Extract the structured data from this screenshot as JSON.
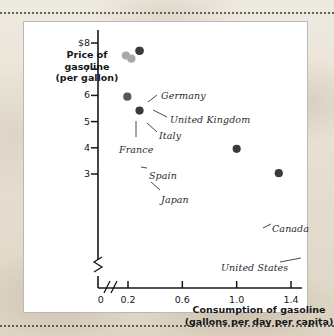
{
  "figure": {
    "background_color": "#e9e3d8",
    "panel_color": "#ffffff",
    "panel_border_color": "#b9b9b9"
  },
  "chart_data": {
    "type": "scatter",
    "title": "",
    "xlabel": "Consumption of gasoline\n(gallons per day per capita)",
    "ylabel": "Price of gasoline\n(per gallon)",
    "xlabel_line1": "Consumption of gasoline",
    "xlabel_line2": "(gallons per day per capita)",
    "ylabel_line1": "Price of",
    "ylabel_line2": "gasoline",
    "ylabel_line3": "(per gallon)",
    "xlim": [
      0,
      1.55
    ],
    "ylim": [
      2.4,
      8.4
    ],
    "x_axis_break": true,
    "y_axis_break": true,
    "grid": false,
    "legend": "none",
    "xticks": [
      {
        "value": 0,
        "label": "0"
      },
      {
        "value": 0.2,
        "label": "0.2"
      },
      {
        "value": 0.6,
        "label": "0.6"
      },
      {
        "value": 1.0,
        "label": "1.0"
      },
      {
        "value": 1.4,
        "label": "1.4"
      }
    ],
    "yticks": [
      {
        "value": 8,
        "label": "$8"
      },
      {
        "value": 7,
        "label": "7"
      },
      {
        "value": 6,
        "label": "6"
      },
      {
        "value": 5,
        "label": "5"
      },
      {
        "value": 4,
        "label": "4"
      },
      {
        "value": 3,
        "label": "3"
      }
    ],
    "marker_colors": {
      "dark": "#3b3b3f",
      "medium": "#58585c",
      "light": "#a9a9ad"
    },
    "points": [
      {
        "name": "Germany",
        "x": 0.285,
        "y": 7.7,
        "shade": "dark",
        "label": "Germany",
        "label_x": 137,
        "label_y": 68,
        "leader": [
          [
            124,
            80
          ],
          [
            133,
            73
          ]
        ]
      },
      {
        "name": "United Kingdom",
        "x": 0.285,
        "y": 7.7,
        "shade": "dark",
        "label": "United Kingdom",
        "label_x": 146,
        "label_y": 92,
        "leader": [
          [
            129,
            88
          ],
          [
            143,
            95
          ]
        ]
      },
      {
        "name": "Italy",
        "x": 0.225,
        "y": 7.4,
        "shade": "light",
        "label": "Italy",
        "label_x": 135,
        "label_y": 108,
        "leader": [
          [
            123,
            101
          ],
          [
            133,
            110
          ]
        ]
      },
      {
        "name": "France",
        "x": 0.185,
        "y": 7.52,
        "shade": "light",
        "label": "France",
        "label_x": 95,
        "label_y": 122,
        "leader": [
          [
            112,
            99
          ],
          [
            112,
            115
          ]
        ]
      },
      {
        "name": "Spain",
        "x": 0.195,
        "y": 5.95,
        "shade": "medium",
        "label": "Spain",
        "label_x": 125,
        "label_y": 148,
        "leader": [
          [
            117,
            145
          ],
          [
            123,
            146
          ]
        ]
      },
      {
        "name": "Japan",
        "x": 0.285,
        "y": 5.42,
        "shade": "dark",
        "label": "Japan",
        "label_x": 137,
        "label_y": 172,
        "leader": [
          [
            127,
            160
          ],
          [
            136,
            168
          ]
        ]
      },
      {
        "name": "Canada",
        "x": 1.0,
        "y": 3.96,
        "shade": "dark",
        "label": "Canada",
        "label_x": 248,
        "label_y": 201,
        "leader": [
          [
            239,
            206
          ],
          [
            247,
            202
          ]
        ]
      },
      {
        "name": "United States",
        "x": 1.31,
        "y": 3.03,
        "shade": "dark",
        "label": "United States",
        "label_x": 197,
        "label_y": 240,
        "leader": [
          [
            277,
            236
          ],
          [
            256,
            240
          ]
        ]
      }
    ]
  }
}
